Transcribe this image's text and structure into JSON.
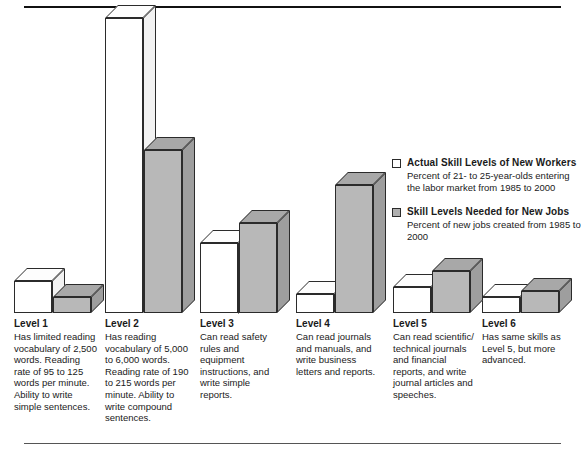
{
  "chart_data": {
    "type": "bar",
    "title": "",
    "subtitle": "",
    "xlabel": "",
    "ylabel": "",
    "grid": false,
    "legend_position": "right-middle",
    "categories": [
      "Level 1",
      "Level 2",
      "Level 3",
      "Level 4",
      "Level 5",
      "Level 6"
    ],
    "series": [
      {
        "name": "Actual Skill Levels of New Workers",
        "description": "Percent of 21- to 25-year-olds entering the labor market from 1985 to 2000",
        "color": "#ffffff",
        "values": [
          10,
          92,
          22,
          6,
          8,
          5
        ]
      },
      {
        "name": "Skill Levels Needed for New Jobs",
        "description": "Percent of new jobs created from 1985 to 2000",
        "color": "#b8b8b8",
        "values": [
          5,
          51,
          28,
          40,
          13,
          7
        ]
      }
    ],
    "ylim": [
      0,
      100
    ],
    "tick_labels": []
  },
  "legend": {
    "items": [
      {
        "swatch": "white-swatch",
        "title": "Actual Skill Levels of New Workers",
        "subtitle": "Percent of 21- to 25-year-olds entering the labor market from 1985 to 2000"
      },
      {
        "swatch": "grey-swatch",
        "title": "Skill Levels Needed for New Jobs",
        "subtitle": "Percent of new jobs created from 1985 to 2000"
      }
    ]
  },
  "levels": [
    {
      "title": "Level 1",
      "body": "Has limited reading vocabulary of 2,500 words. Reading rate of 95 to 125 words per minute. Ability to write simple sentences."
    },
    {
      "title": "Level 2",
      "body": "Has reading vocabulary of 5,000 to 6,000 words. Reading rate of 190 to 215 words per minute. Ability to write compound sentences."
    },
    {
      "title": "Level 3",
      "body": "Can read safety rules and equipment instructions, and write simple reports."
    },
    {
      "title": "Level 4",
      "body": "Can read journals and manuals, and write business letters and reports."
    },
    {
      "title": "Level 5",
      "body": "Can read scientific/ technical journals and financial reports, and write journal articles and speeches."
    },
    {
      "title": "Level 6",
      "body": "Has same skills as Level 5, but more advanced."
    }
  ],
  "colors": {
    "actual_series": "#ffffff",
    "needed_series": "#b8b8b8",
    "outline": "#2b2b2b",
    "rule": "#111111",
    "text": "#1a1a1a"
  }
}
